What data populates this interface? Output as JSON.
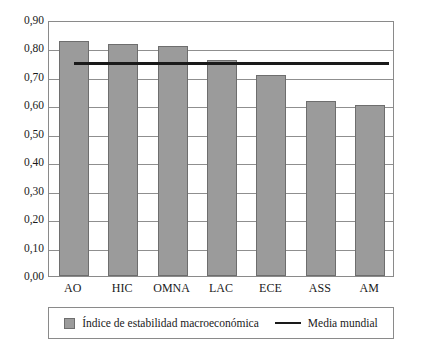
{
  "chart_data": {
    "type": "bar",
    "title": "",
    "subtitle": "",
    "xlabel": "",
    "ylabel": "",
    "categories": [
      "AO",
      "HIC",
      "OMNA",
      "LAC",
      "ECE",
      "ASS",
      "AM"
    ],
    "series": [
      {
        "name": "Índice de estabilidad macroeconómica",
        "type": "bar",
        "color": "#9b9b9b",
        "values": [
          0.827,
          0.815,
          0.807,
          0.76,
          0.708,
          0.617,
          0.602
        ]
      },
      {
        "name": "Media mundial",
        "type": "reference-line",
        "color": "#1a1a1a",
        "value": 0.757
      }
    ],
    "ylim": [
      0.0,
      0.9
    ],
    "ytick_values": [
      0.0,
      0.1,
      0.2,
      0.3,
      0.4,
      0.5,
      0.6,
      0.7,
      0.8,
      0.9
    ],
    "ytick_labels": [
      "0,00",
      "0,10",
      "0,20",
      "0,30",
      "0,40",
      "0,50",
      "0,60",
      "0,70",
      "0,80",
      "0,90"
    ],
    "grid": true,
    "grid_axis": "y",
    "legend_position": "bottom",
    "legend": [
      {
        "label": "Índice de estabilidad macroeconómica",
        "marker": "square-swatch",
        "color": "#9b9b9b"
      },
      {
        "label": "Media mundial",
        "marker": "line",
        "color": "#1a1a1a"
      }
    ]
  },
  "colors": {
    "bar_fill": "#9b9b9b",
    "bar_stroke": "#6e6e6e",
    "mean_line": "#1a1a1a",
    "grid": "#8f8f8f",
    "frame": "#8a8a8a",
    "background": "#ffffff",
    "text": "#1a1a1a"
  }
}
